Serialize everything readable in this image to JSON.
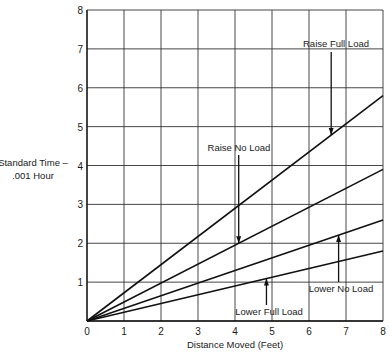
{
  "chart_data": {
    "type": "line",
    "title": "",
    "xlabel": "Distance Moved (Feet)",
    "ylabel_line1": "Standard Time –",
    "ylabel_line2": ".001 Hour",
    "ylabel": "Standard Time – .001 Hour",
    "xlim": [
      0,
      8
    ],
    "ylim": [
      0,
      8
    ],
    "grid": true,
    "legend_position": "inline annotations with arrows",
    "x_ticks": [
      "0",
      "1",
      "2",
      "3",
      "4",
      "5",
      "6",
      "7",
      "8"
    ],
    "y_ticks": [
      "0",
      "1",
      "2",
      "3",
      "4",
      "5",
      "6",
      "7",
      "8"
    ],
    "x": [
      0,
      8
    ],
    "series": [
      {
        "name": "Raise Full Load",
        "values": [
          0,
          5.8
        ]
      },
      {
        "name": "Raise No Load",
        "values": [
          0,
          3.9
        ]
      },
      {
        "name": "Lower No Load",
        "values": [
          0,
          2.6
        ]
      },
      {
        "name": "Lower Full Load",
        "values": [
          0,
          1.8
        ]
      }
    ],
    "annotations": [
      {
        "text": "Raise Full Load",
        "series": 0,
        "arrow_x": 6.6,
        "direction": "down"
      },
      {
        "text": "Raise No Load",
        "series": 1,
        "arrow_x": 4.1,
        "direction": "down"
      },
      {
        "text": "Lower No Load",
        "series": 2,
        "arrow_x": 6.8,
        "direction": "up"
      },
      {
        "text": "Lower Full Load",
        "series": 3,
        "arrow_x": 4.85,
        "direction": "up"
      }
    ]
  }
}
